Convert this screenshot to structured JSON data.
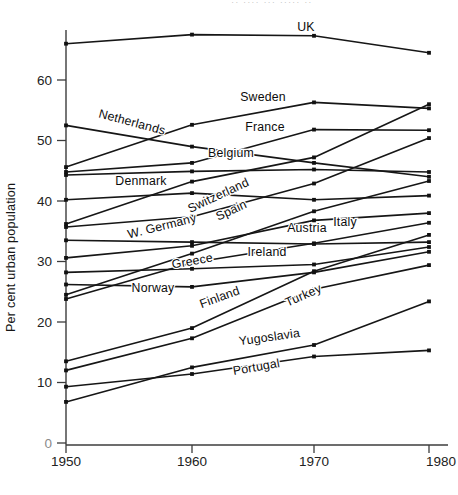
{
  "figure": {
    "top_clipped_text": "·· ···· ··· ····· ··",
    "y_axis_title": "Per cent urban population"
  },
  "chart_data": {
    "type": "line",
    "title": "",
    "xlabel": "",
    "ylabel": "Per cent urban population",
    "x": [
      1950,
      1960,
      1970,
      1980
    ],
    "x_tick_labels": [
      "1950",
      "1960",
      "1970",
      "1980"
    ],
    "y_ticks": [
      0,
      10,
      20,
      30,
      40,
      50,
      60
    ],
    "ylim": [
      0,
      70
    ],
    "grid": false,
    "legend_position": "inline-labels-on-lines",
    "line_color": "#161616",
    "series": [
      {
        "name": "UK",
        "values": [
          66.0,
          67.5,
          67.3,
          64.5
        ],
        "label": {
          "x": 306,
          "y": 31,
          "rot": 0
        }
      },
      {
        "name": "Sweden",
        "values": [
          45.6,
          52.6,
          56.3,
          55.3
        ],
        "label": {
          "x": 263,
          "y": 101,
          "rot": 0
        }
      },
      {
        "name": "Netherlands",
        "values": [
          52.5,
          49.0,
          46.3,
          44.0
        ],
        "label": {
          "x": 131,
          "y": 126,
          "rot": 15
        }
      },
      {
        "name": "France",
        "values": [
          44.8,
          46.3,
          51.8,
          51.7
        ],
        "label": {
          "x": 265,
          "y": 131,
          "rot": 0
        }
      },
      {
        "name": "Belgium",
        "values": [
          44.3,
          44.9,
          45.2,
          44.8
        ],
        "label": {
          "x": 231,
          "y": 157,
          "rot": 0
        }
      },
      {
        "name": "Denmark",
        "values": [
          40.2,
          41.3,
          40.2,
          40.9
        ],
        "label": {
          "x": 141,
          "y": 185,
          "rot": 0
        }
      },
      {
        "name": "Switzerland",
        "values": [
          36.2,
          43.2,
          47.2,
          56.0
        ],
        "label": {
          "x": 220,
          "y": 199,
          "rot": -25
        }
      },
      {
        "name": "Spain",
        "values": [
          24.5,
          31.3,
          38.3,
          43.3
        ],
        "label": {
          "x": 233,
          "y": 214,
          "rot": -25
        }
      },
      {
        "name": "W. Germany",
        "values": [
          35.7,
          37.4,
          42.9,
          50.4
        ],
        "label": {
          "x": 163,
          "y": 230,
          "rot": -14
        }
      },
      {
        "name": "Austria",
        "values": [
          33.5,
          33.2,
          32.9,
          33.2
        ],
        "label": {
          "x": 307,
          "y": 232,
          "rot": 0
        }
      },
      {
        "name": "Italy",
        "values": [
          30.6,
          32.6,
          36.8,
          38.0
        ],
        "label": {
          "x": 345,
          "y": 226,
          "rot": 0
        }
      },
      {
        "name": "Ireland",
        "values": [
          28.2,
          28.8,
          29.5,
          32.4
        ],
        "label": {
          "x": 267,
          "y": 256,
          "rot": 0
        }
      },
      {
        "name": "Greece",
        "values": [
          23.8,
          29.8,
          33.0,
          36.4
        ],
        "label": {
          "x": 193,
          "y": 265,
          "rot": -10
        }
      },
      {
        "name": "Norway",
        "values": [
          26.2,
          25.8,
          28.2,
          31.6
        ],
        "label": {
          "x": 153,
          "y": 292,
          "rot": 0
        }
      },
      {
        "name": "Finland",
        "values": [
          13.5,
          19.0,
          28.4,
          34.4
        ],
        "label": {
          "x": 221,
          "y": 301,
          "rot": -20
        }
      },
      {
        "name": "Turkey",
        "values": [
          12.0,
          17.3,
          25.4,
          29.4
        ],
        "label": {
          "x": 305,
          "y": 299,
          "rot": -24
        }
      },
      {
        "name": "Yugoslavia",
        "values": [
          6.8,
          12.5,
          16.2,
          23.4
        ],
        "label": {
          "x": 270,
          "y": 341,
          "rot": -8
        }
      },
      {
        "name": "Portugal",
        "values": [
          9.3,
          11.4,
          14.3,
          15.3
        ],
        "label": {
          "x": 257,
          "y": 371,
          "rot": -10
        }
      }
    ]
  }
}
